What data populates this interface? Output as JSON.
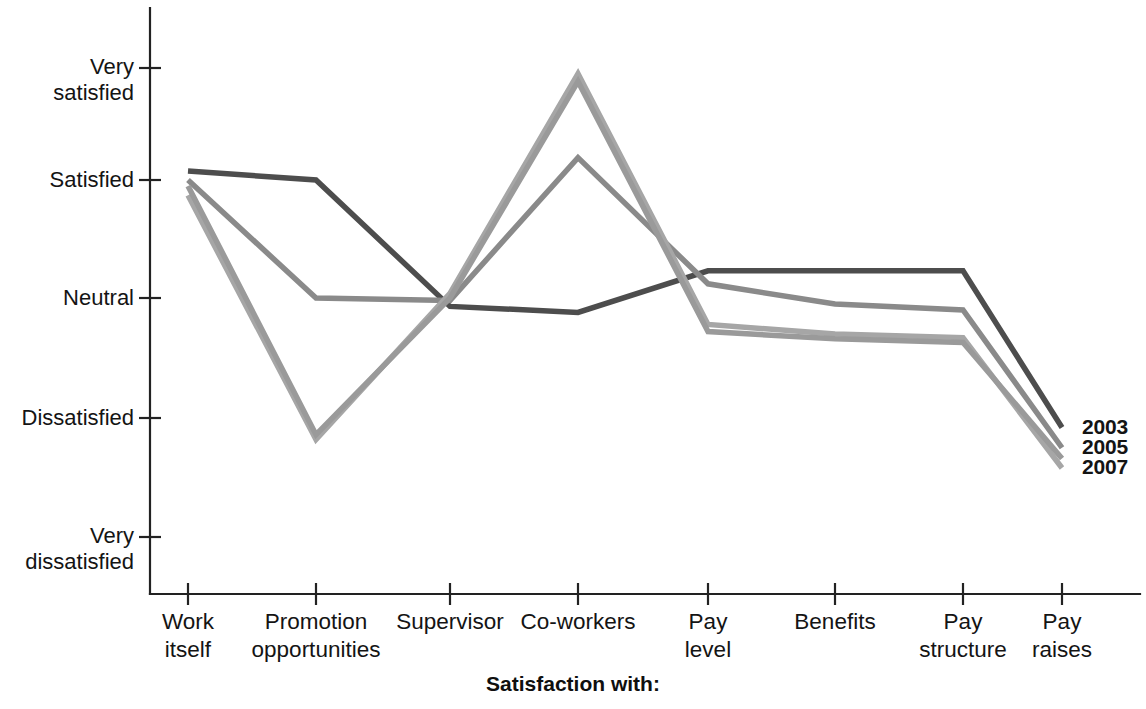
{
  "chart_data": {
    "type": "line",
    "title": "",
    "subtitle": "",
    "xlabel": "Satisfaction with:",
    "ylabel": "",
    "categories": [
      "Work\nitself",
      "Promotion\nopportunities",
      "Supervisor",
      "Co-workers",
      "Pay\nlevel",
      "Benefits",
      "Pay\nstructure",
      "Pay\nraises"
    ],
    "category_names": [
      "Work itself",
      "Promotion opportunities",
      "Supervisor",
      "Co-workers",
      "Pay level",
      "Benefits",
      "Pay structure",
      "Pay raises"
    ],
    "ytick_labels": [
      "Very\nsatisfied",
      "Satisfied",
      "Neutral",
      "Dissatisfied",
      "Very\ndissatisfied"
    ],
    "ytick_values": [
      5,
      4,
      3,
      2,
      1
    ],
    "ylim": [
      1,
      5
    ],
    "grid": false,
    "legend_position": "right-end-of-line",
    "series": [
      {
        "name": "2003",
        "color": "#4d4d4d",
        "values": [
          4.08,
          4.0,
          2.93,
          2.88,
          3.23,
          3.23,
          3.23,
          1.92
        ]
      },
      {
        "name": "2005",
        "color": "#8a8a8a",
        "values": [
          4.0,
          3.0,
          2.98,
          4.2,
          3.12,
          2.95,
          2.9,
          1.75
        ]
      },
      {
        "name": "2007",
        "color": "#a6a6a6",
        "values": [
          3.87,
          1.82,
          3.04,
          4.95,
          2.78,
          2.7,
          2.67,
          1.58
        ]
      },
      {
        "name": "2007b",
        "color": "#9a9a9a",
        "values": [
          3.95,
          1.86,
          3.0,
          4.88,
          2.72,
          2.66,
          2.63,
          1.66
        ]
      }
    ],
    "series_visible_legend": [
      "2003",
      "2005",
      "2007"
    ],
    "legend_entries": [
      {
        "label": "2003",
        "color": "#4d4d4d"
      },
      {
        "label": "2005",
        "color": "#8a8a8a"
      },
      {
        "label": "2007",
        "color": "#a6a6a6"
      }
    ]
  },
  "axis": {
    "x_title": "Satisfaction with:"
  }
}
